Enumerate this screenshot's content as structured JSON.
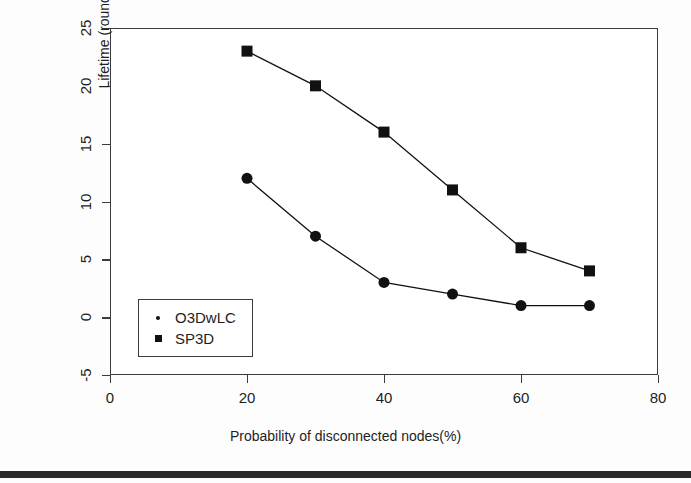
{
  "chart_data": {
    "type": "line",
    "title": "",
    "xlabel": "Probability of disconnected nodes(%)",
    "ylabel": "Lifetime (rounds)",
    "x": [
      20,
      30,
      40,
      50,
      60,
      70
    ],
    "xlim": [
      0,
      80
    ],
    "ylim": [
      -5,
      25
    ],
    "xticks": [
      "0",
      "20",
      "40",
      "60",
      "80"
    ],
    "xtick_values": [
      0,
      20,
      40,
      60,
      80
    ],
    "yticks": [
      "-5",
      "0",
      "5",
      "10",
      "15",
      "20",
      "25"
    ],
    "ytick_values": [
      -5,
      0,
      5,
      10,
      15,
      20,
      25
    ],
    "grid": false,
    "legend_position": "bottom-left",
    "series": [
      {
        "name": "O3DwLC",
        "marker": "circle",
        "values": [
          12,
          7,
          3,
          2,
          1,
          1
        ],
        "color": "#111111"
      },
      {
        "name": "SP3D",
        "marker": "square",
        "values": [
          23,
          20,
          16,
          11,
          6,
          4
        ],
        "color": "#111111"
      }
    ]
  },
  "legend": {
    "items": [
      {
        "label": "O3DwLC",
        "marker": "circle-marker-icon"
      },
      {
        "label": "SP3D",
        "marker": "square-marker-icon"
      }
    ]
  }
}
